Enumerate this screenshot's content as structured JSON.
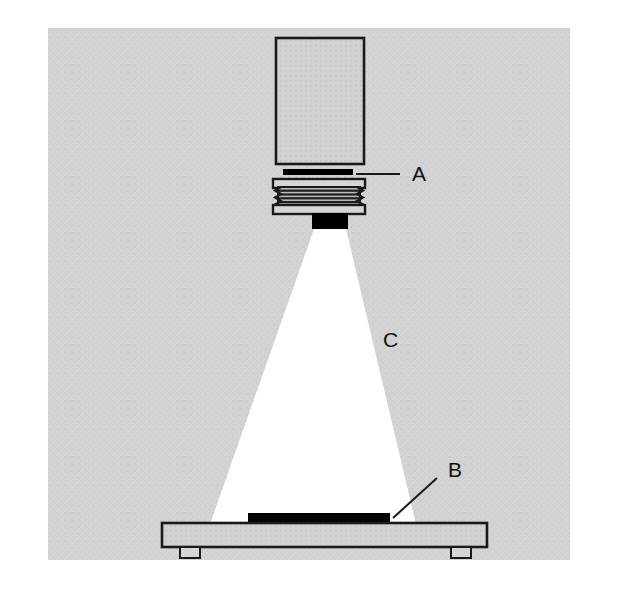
{
  "figure": {
    "type": "technical-line-diagram",
    "canvas": {
      "width": 627,
      "height": 590,
      "background": "#ffffff"
    },
    "panel": {
      "name": "halftone-background-panel",
      "x": 48,
      "y": 28,
      "width": 522,
      "height": 532,
      "fill": "#d3d3d3",
      "texture": "halftone-dot-screen"
    }
  },
  "colors": {
    "panel_gray": "#d3d3d3",
    "panel_gray_light": "#dcdcdc",
    "body_fill": "#d0d0d0",
    "outline": "#1a1a1a",
    "black_part": "#000000",
    "light_beam": "#ffffff",
    "thread_shade": "#8f8f8f",
    "label_text": "#111111"
  },
  "parts": {
    "lens_barrel": {
      "name": "lens-barrel-body",
      "x": 276,
      "y": 38,
      "width": 88,
      "height": 126,
      "fill": "#d0d0d0",
      "stroke": "#1a1a1a",
      "stroke_width": 2.6
    },
    "aperture_plate": {
      "name": "aperture-plate-bar",
      "x": 283,
      "y": 169,
      "width": 70,
      "height": 6,
      "fill": "#000000",
      "label_ref": "A"
    },
    "threaded_collar": {
      "name": "threaded-collar",
      "x": 273,
      "y": 179,
      "width": 92,
      "height": 34,
      "flange_top": {
        "x": 273,
        "y": 179,
        "width": 92,
        "height": 8
      },
      "flange_bottom": {
        "x": 273,
        "y": 205,
        "width": 92,
        "height": 8
      },
      "thread_band": {
        "x": 278,
        "y": 187,
        "width": 82,
        "height": 18
      },
      "thread_line_count": 5,
      "thread_tooth_count": 5,
      "fill": "#c8c8c8",
      "stroke": "#1a1a1a"
    },
    "aperture_block": {
      "name": "aperture-exit-block",
      "x": 312,
      "y": 213,
      "width": 36,
      "height": 16,
      "fill": "#000000"
    },
    "light_cone": {
      "name": "light-beam-cone",
      "apex_left_x": 314,
      "apex_right_x": 346,
      "apex_y": 229,
      "base_left_x": 210,
      "base_right_x": 416,
      "base_y": 524,
      "fill": "#ffffff",
      "label_ref": "C"
    },
    "specimen": {
      "name": "specimen-sample-bar",
      "x": 248,
      "y": 513,
      "width": 142,
      "height": 12,
      "fill": "#000000",
      "label_ref": "B"
    },
    "stage": {
      "name": "stage-platform",
      "x": 162,
      "y": 523,
      "width": 325,
      "height": 24,
      "fill": "#d0d0d0",
      "stroke": "#1a1a1a",
      "stroke_width": 2.6
    },
    "stage_feet": [
      {
        "name": "stage-foot-left",
        "x": 180,
        "y": 547,
        "width": 20,
        "height": 11
      },
      {
        "name": "stage-foot-right",
        "x": 451,
        "y": 547,
        "width": 20,
        "height": 11
      }
    ]
  },
  "callouts": [
    {
      "id": "A",
      "name": "callout-a",
      "label": "A",
      "refers_to": "aperture-plate-bar",
      "text_x": 412,
      "text_y": 175,
      "leader": {
        "x1": 356,
        "y1": 174,
        "x2": 400,
        "y2": 174,
        "style": "straight-horizontal"
      }
    },
    {
      "id": "B",
      "name": "callout-b",
      "label": "B",
      "refers_to": "specimen-sample-bar",
      "text_x": 448,
      "text_y": 471,
      "leader": {
        "x1": 393,
        "y1": 518,
        "x2": 437,
        "y2": 478,
        "style": "diagonal"
      }
    },
    {
      "id": "C",
      "name": "callout-c",
      "label": "C",
      "refers_to": "light-beam-cone",
      "text_x": 383,
      "text_y": 341,
      "leader": null
    }
  ]
}
